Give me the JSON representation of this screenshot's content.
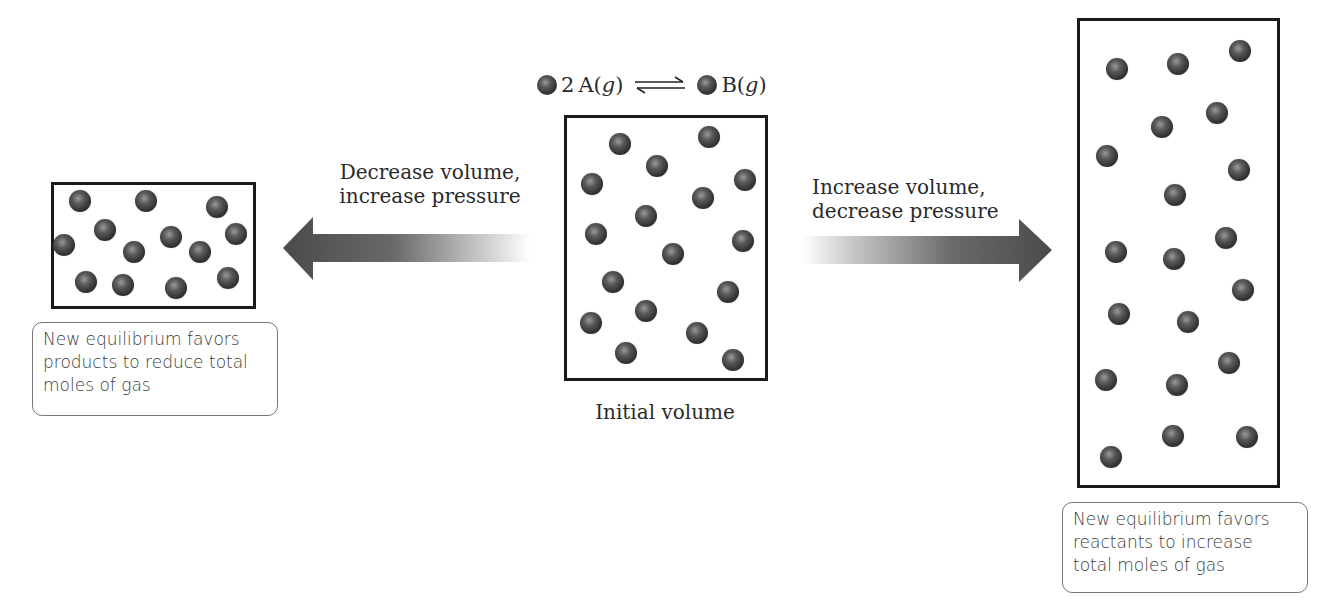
{
  "equation": {
    "reactant_coef": "2",
    "reactant": "A",
    "reactant_state": "g",
    "arrow": "equilibrium-arrows",
    "product": "B",
    "product_state": "g"
  },
  "center": {
    "label": "Initial volume",
    "particles": [
      [
        620,
        144
      ],
      [
        709,
        137
      ],
      [
        657,
        166
      ],
      [
        592,
        184
      ],
      [
        745,
        180
      ],
      [
        703,
        198
      ],
      [
        646,
        216
      ],
      [
        596,
        234
      ],
      [
        743,
        241
      ],
      [
        673,
        254
      ],
      [
        613,
        282
      ],
      [
        728,
        292
      ],
      [
        646,
        311
      ],
      [
        591,
        323
      ],
      [
        697,
        333
      ],
      [
        626,
        353
      ],
      [
        733,
        360
      ]
    ]
  },
  "left": {
    "arrow_label_line1": "Decrease volume,",
    "arrow_label_line2": "increase pressure",
    "caption": "New equilibrium favors products to reduce total moles of gas",
    "particles": [
      [
        80,
        201
      ],
      [
        146,
        201
      ],
      [
        217,
        207
      ],
      [
        105,
        230
      ],
      [
        64,
        245
      ],
      [
        171,
        237
      ],
      [
        134,
        252
      ],
      [
        200,
        252
      ],
      [
        236,
        234
      ],
      [
        86,
        282
      ],
      [
        123,
        285
      ],
      [
        176,
        288
      ],
      [
        228,
        278
      ]
    ]
  },
  "right": {
    "arrow_label_line1": "Increase volume,",
    "arrow_label_line2": "decrease pressure",
    "caption": "New equilibrium favors reactants to increase total moles of gas",
    "particles": [
      [
        1117,
        69
      ],
      [
        1178,
        64
      ],
      [
        1240,
        51
      ],
      [
        1162,
        127
      ],
      [
        1217,
        113
      ],
      [
        1107,
        156
      ],
      [
        1239,
        170
      ],
      [
        1175,
        195
      ],
      [
        1116,
        252
      ],
      [
        1174,
        259
      ],
      [
        1226,
        238
      ],
      [
        1243,
        290
      ],
      [
        1119,
        314
      ],
      [
        1188,
        322
      ],
      [
        1106,
        380
      ],
      [
        1177,
        385
      ],
      [
        1229,
        363
      ],
      [
        1173,
        436
      ],
      [
        1247,
        437
      ],
      [
        1111,
        457
      ]
    ]
  },
  "colors": {
    "arrow_dark": "#4a4a4a",
    "arrow_light": "#ffffff",
    "box_border": "#1a1a1a"
  }
}
